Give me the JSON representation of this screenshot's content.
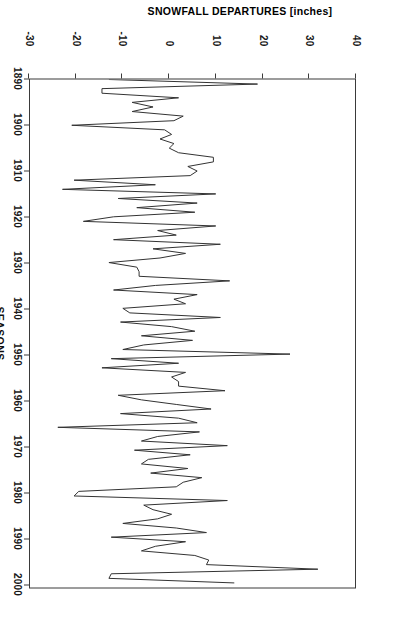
{
  "chart_data": {
    "type": "line",
    "title": "",
    "xlabel": "SEASONS",
    "ylabel": "SNOWFALL DEPARTURES [inches]",
    "xlim": [
      1890,
      2001
    ],
    "ylim": [
      -30,
      40
    ],
    "xticks": [
      1890,
      1900,
      1910,
      1920,
      1930,
      1940,
      1950,
      1960,
      1970,
      1980,
      1990,
      2000
    ],
    "yticks": [
      -30,
      -20,
      -10,
      0,
      10,
      20,
      30,
      40
    ],
    "grid": false,
    "legend": false,
    "line_color": "#333333",
    "x": [
      1890,
      1891,
      1892,
      1893,
      1894,
      1895,
      1896,
      1897,
      1898,
      1899,
      1900,
      1901,
      1902,
      1903,
      1904,
      1905,
      1906,
      1907,
      1908,
      1909,
      1910,
      1911,
      1912,
      1913,
      1914,
      1915,
      1916,
      1917,
      1918,
      1919,
      1920,
      1921,
      1922,
      1923,
      1924,
      1925,
      1926,
      1927,
      1928,
      1929,
      1930,
      1931,
      1932,
      1933,
      1934,
      1935,
      1936,
      1937,
      1938,
      1939,
      1940,
      1941,
      1942,
      1943,
      1944,
      1945,
      1946,
      1947,
      1948,
      1949,
      1950,
      1951,
      1952,
      1953,
      1954,
      1955,
      1956,
      1957,
      1958,
      1959,
      1960,
      1961,
      1962,
      1963,
      1964,
      1965,
      1966,
      1967,
      1968,
      1969,
      1970,
      1971,
      1972,
      1973,
      1974,
      1975,
      1976,
      1977,
      1978,
      1979,
      1980,
      1981,
      1982,
      1983,
      1984,
      1985,
      1986,
      1987,
      1988,
      1989,
      1990,
      1991,
      1992,
      1993,
      1994,
      1995,
      1996,
      1997,
      1998,
      1999,
      2000
    ],
    "y": [
      -13.0,
      19.0,
      -14.5,
      -14.5,
      2.0,
      -8.0,
      -3.5,
      -8.0,
      3.0,
      1.0,
      -21.0,
      -1.0,
      0.5,
      -2.0,
      1.0,
      0.0,
      2.0,
      9.5,
      9.5,
      4.0,
      6.0,
      4.5,
      -20.5,
      -3.0,
      -23.0,
      10.0,
      -11.0,
      6.0,
      -7.0,
      5.5,
      -12.0,
      -18.5,
      10.0,
      -2.5,
      1.5,
      -12.0,
      11.0,
      -3.5,
      3.5,
      -2.0,
      -13.0,
      -7.0,
      -6.5,
      -6.5,
      13.0,
      -3.0,
      -12.0,
      6.0,
      1.0,
      3.5,
      -10.0,
      -8.5,
      11.0,
      -10.5,
      0.5,
      5.5,
      -6.0,
      5.0,
      -5.5,
      -10.0,
      26.0,
      -12.5,
      2.0,
      -14.5,
      3.5,
      0.5,
      2.0,
      2.0,
      12.0,
      -11.0,
      -6.0,
      1.5,
      9.0,
      -10.5,
      2.0,
      6.0,
      -24.0,
      6.5,
      -2.5,
      -6.0,
      12.5,
      -7.5,
      4.5,
      -4.5,
      -6.0,
      4.0,
      -4.0,
      7.0,
      3.0,
      1.5,
      -19.5,
      -20.5,
      12.5,
      -5.5,
      -3.5,
      0.5,
      -2.5,
      -10.0,
      1.5,
      8.0,
      -12.5,
      3.5,
      -3.0,
      -6.0,
      5.5,
      8.5,
      8.0,
      32.0,
      -12.5,
      -13.0,
      14.0
    ]
  },
  "axes": {
    "x_title": "SEASONS",
    "y_title": "SNOWFALL DEPARTURES [inches]",
    "x_tick_labels": [
      "1890",
      "1900",
      "1910",
      "1920",
      "1930",
      "1940",
      "1950",
      "1960",
      "1970",
      "1980",
      "1990",
      "2000"
    ],
    "y_tick_labels": [
      "-30",
      "-20",
      "-10",
      "0",
      "10",
      "20",
      "30",
      "40"
    ]
  }
}
